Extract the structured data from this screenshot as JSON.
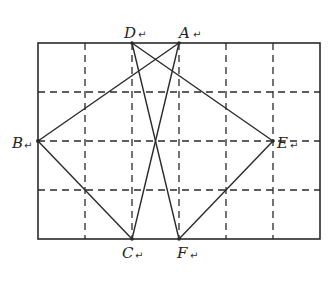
{
  "figure": {
    "type": "grid-geometry-diagram",
    "colors": {
      "background": "#ffffff",
      "stroke": "#2a2a2a",
      "grid": "#2a2a2a"
    },
    "grid": {
      "columns": 6,
      "rows": 4,
      "rect": {
        "x": 38,
        "y": 43,
        "width": 282,
        "height": 196
      },
      "vertical_lines_x": [
        85,
        132,
        179,
        226,
        273
      ],
      "horizontal_lines_y": [
        92,
        141,
        190
      ]
    },
    "points": {
      "D": {
        "label": "D",
        "x": 132,
        "y": 43
      },
      "A": {
        "label": "A",
        "x": 179,
        "y": 43
      },
      "B": {
        "label": "B",
        "x": 38,
        "y": 141
      },
      "E": {
        "label": "E",
        "x": 273,
        "y": 141
      },
      "C": {
        "label": "C",
        "x": 132,
        "y": 239
      },
      "F": {
        "label": "F",
        "x": 179,
        "y": 239
      }
    },
    "segments": [
      [
        "D",
        "E"
      ],
      [
        "D",
        "F"
      ],
      [
        "A",
        "B"
      ],
      [
        "A",
        "C"
      ],
      [
        "B",
        "C"
      ],
      [
        "E",
        "F"
      ]
    ],
    "labels": {
      "D": "D",
      "A": "A",
      "B": "B",
      "E": "E",
      "C": "C",
      "F": "F",
      "return_mark": "↵"
    }
  }
}
